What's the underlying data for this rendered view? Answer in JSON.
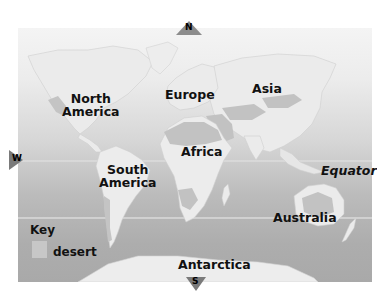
{
  "map": {
    "title": "World continents with deserts",
    "continents": [
      {
        "id": "north-america",
        "label_line1": "North",
        "label_line2": "America"
      },
      {
        "id": "south-america",
        "label_line1": "South",
        "label_line2": "America"
      },
      {
        "id": "europe",
        "label": "Europe"
      },
      {
        "id": "asia",
        "label": "Asia"
      },
      {
        "id": "africa",
        "label": "Africa"
      },
      {
        "id": "australia",
        "label": "Australia"
      },
      {
        "id": "antarctica",
        "label": "Antarctica"
      }
    ],
    "lines": {
      "equator_label": "Equator"
    },
    "compass": {
      "north": "N",
      "south": "S",
      "west": "W"
    },
    "key": {
      "title": "Key",
      "items": [
        {
          "label": "desert",
          "color": "#c7c7c7"
        }
      ]
    },
    "colors": {
      "land": "#ebebeb",
      "desert": "#c2c2c2",
      "ocean_top": "#f4f4f4",
      "ocean_bottom": "#a9a9a9",
      "line": "#e6e6e6",
      "compass": "#8a8a8a"
    }
  }
}
